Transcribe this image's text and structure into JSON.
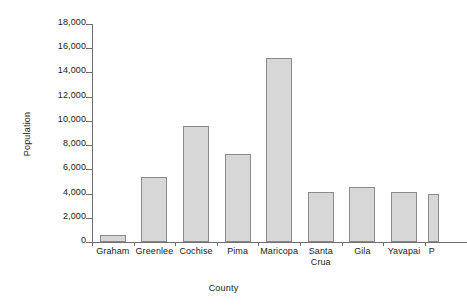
{
  "chart_data": {
    "type": "bar",
    "title": "",
    "xlabel": "County",
    "ylabel": "Population",
    "ylim": [
      0,
      18000
    ],
    "ytick_step": 2000,
    "grid": false,
    "legend": null,
    "bar_fill_color": "#d7d7d7",
    "bar_border_color": "#8a8a8a",
    "axis_color": "#6e6e6e",
    "background_color": "#ffffff",
    "note": "last category is clipped at the right edge of the image",
    "categories": [
      "Graham",
      "Greenlee",
      "Cochise",
      "Pima",
      "Maricopa",
      "Santa Crua",
      "Gila",
      "Yavapai",
      "P"
    ],
    "category_lines": [
      [
        "Graham"
      ],
      [
        "Greenlee"
      ],
      [
        "Cochise"
      ],
      [
        "Pima"
      ],
      [
        "Maricopa"
      ],
      [
        "Santa",
        "Crua"
      ],
      [
        "Gila"
      ],
      [
        "Yavapai"
      ],
      [
        "P"
      ]
    ],
    "values": [
      600,
      5400,
      9600,
      7300,
      15200,
      4100,
      4550,
      4150,
      3950
    ],
    "ytick_labels": [
      "0",
      "2,000",
      "4,000",
      "6,000",
      "8,000",
      "10,000",
      "12,000",
      "14,000",
      "16,000",
      "18,000"
    ],
    "ytick_values": [
      0,
      2000,
      4000,
      6000,
      8000,
      10000,
      12000,
      14000,
      16000,
      18000
    ]
  }
}
